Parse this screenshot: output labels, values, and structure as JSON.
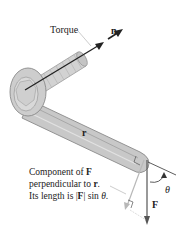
{
  "figure": {
    "labels": {
      "torque": "Torque",
      "normal_vector": "n",
      "position_vector": "r",
      "force": "F",
      "angle": "θ"
    },
    "caption": {
      "line1_prefix": "Component of ",
      "line1_bold": "F",
      "line2_prefix": "perpendicular to ",
      "line2_bold": "r",
      "line2_suffix": ".",
      "line3_prefix": "Its length is |",
      "line3_bold": "F",
      "line3_mid": "| sin ",
      "line3_italic": "θ",
      "line3_suffix": "."
    },
    "colors": {
      "wrench_fill": "#c8c8c8",
      "wrench_edge": "#8a8a8a",
      "vector": "#222222",
      "component": "#b0b0b0"
    }
  }
}
